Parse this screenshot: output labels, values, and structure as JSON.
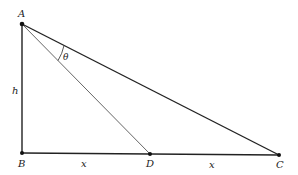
{
  "diagram": {
    "type": "geometry-triangle",
    "points": {
      "A": {
        "label": "A",
        "x": 22,
        "y": 24
      },
      "B": {
        "label": "B",
        "x": 22,
        "y": 153
      },
      "D": {
        "label": "D",
        "x": 150,
        "y": 154
      },
      "C": {
        "label": "C",
        "x": 279,
        "y": 155
      }
    },
    "segment_labels": {
      "h": "h",
      "x_left": "x",
      "x_right": "x",
      "theta": "θ"
    },
    "colors": {
      "stroke": "#222222",
      "thin_stroke": "#555555",
      "background": "#ffffff"
    }
  }
}
